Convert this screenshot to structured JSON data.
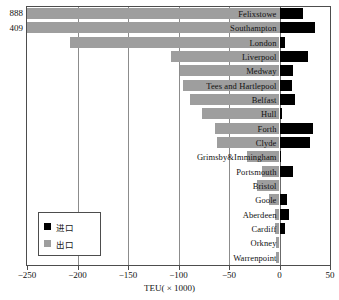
{
  "chart_data": {
    "type": "bar",
    "orientation": "horizontal",
    "title": "",
    "xlabel": "TEU( × 1000)",
    "ylabel": "",
    "xlim": [
      -250,
      50
    ],
    "xticks": [
      -250,
      -200,
      -150,
      -100,
      -50,
      0,
      50
    ],
    "xticklabels": [
      "−250",
      "−200",
      "−150",
      "−100",
      "−50",
      "0",
      "50"
    ],
    "grid": true,
    "grid_axis": "x",
    "legend_position": "bottom-left",
    "categories": [
      "Felixstowe",
      "Southampton",
      "London",
      "Liverpool",
      "Medway",
      "Tees and Hartlepool",
      "Belfast",
      "Hull",
      "Forth",
      "Clyde",
      "Grimsby&Immingham",
      "Portsmouth",
      "Bristol",
      "Goole",
      "Aberdeen",
      "Cardiff",
      "Orkney",
      "Warrenpoint"
    ],
    "series": [
      {
        "name": "出口",
        "label_en": "exports",
        "color": "#9e9e9e",
        "values": [
          -888,
          -409,
          -207,
          -107,
          -99,
          -96,
          -89,
          -77,
          -64,
          -62,
          -32,
          -17,
          -22,
          -10,
          -4,
          -4,
          -3,
          -3
        ]
      },
      {
        "name": "进口",
        "label_en": "imports",
        "color": "#000000",
        "values": [
          23,
          35,
          5,
          28,
          13,
          12,
          15,
          2,
          33,
          30,
          1,
          13,
          0,
          7,
          9,
          5,
          0,
          0
        ]
      }
    ],
    "truncated_annotations": [
      {
        "category": "Felixstowe",
        "value": "888"
      },
      {
        "category": "Southampton",
        "value": "409"
      }
    ]
  },
  "legend": {
    "items": [
      {
        "label": "进口",
        "color": "#000000"
      },
      {
        "label": "出口",
        "color": "#9e9e9e"
      }
    ]
  }
}
